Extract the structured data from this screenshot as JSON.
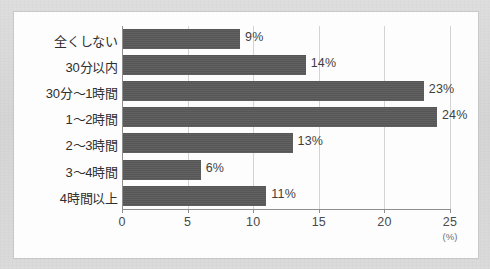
{
  "chart_data": {
    "type": "bar",
    "orientation": "horizontal",
    "title": "",
    "xlabel": "(%)",
    "ylabel": "",
    "categories": [
      "全くしない",
      "30分以内",
      "30分～1時間",
      "1～2時間",
      "2～3時間",
      "3～4時間",
      "4時間以上"
    ],
    "values": [
      9,
      14,
      23,
      24,
      13,
      6,
      11
    ],
    "value_labels": [
      "9%",
      "14%",
      "23%",
      "24%",
      "13%",
      "6%",
      "11%"
    ],
    "xlim": [
      0,
      25
    ],
    "xticks": [
      0,
      5,
      10,
      15,
      20,
      25
    ],
    "xtick_labels": [
      "0",
      "5",
      "10",
      "15",
      "20",
      "25"
    ],
    "unit": "(%)",
    "grid": "vertical",
    "legend": "none",
    "colors": {
      "bar": "#595959",
      "gridline": "#d3d3d3",
      "axis": "#8e8e8e",
      "text": "#2f2f2f",
      "plot_background": "#fdfdfd",
      "page_background": "#d8d8d8"
    }
  }
}
